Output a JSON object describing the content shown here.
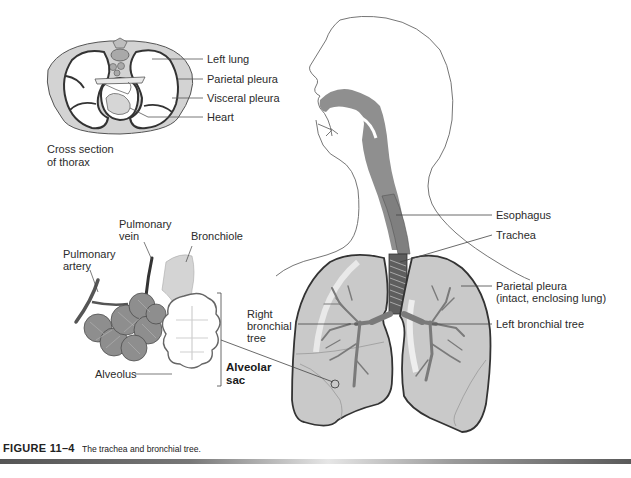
{
  "figure": {
    "number": "FIGURE 11–4",
    "caption": "The trachea and bronchial tree."
  },
  "cross_section": {
    "title": "Cross section\nof thorax",
    "labels": {
      "left_lung": "Left lung",
      "parietal_pleura": "Parietal pleura",
      "visceral_pleura": "Visceral pleura",
      "heart": "Heart"
    }
  },
  "alveoli": {
    "labels": {
      "pulmonary_vein": "Pulmonary\nvein",
      "pulmonary_artery": "Pulmonary\nartery",
      "bronchiole": "Bronchiole",
      "alveolus": "Alveolus",
      "alveolar_sac": "Alveolar\nsac"
    }
  },
  "main": {
    "labels": {
      "esophagus": "Esophagus",
      "trachea": "Trachea",
      "parietal_pleura": "Parietal pleura\n(intact, enclosing lung)",
      "right_bronchial_tree": "Right\nbronchial\ntree",
      "left_bronchial_tree": "Left bronchial tree"
    }
  },
  "colors": {
    "lung_fill": "#c9c9c9",
    "airway_fill": "#8a8a8a",
    "outline": "#333333",
    "pleura_fill": "#d0d0d0"
  }
}
